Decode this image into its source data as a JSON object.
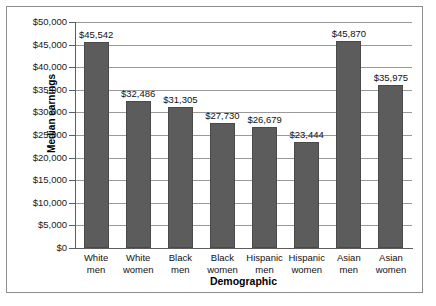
{
  "chart_data": {
    "type": "bar",
    "title": "",
    "xlabel": "Demographic",
    "ylabel": "Median earnings",
    "categories": [
      "White men",
      "White women",
      "Black men",
      "Black women",
      "Hispanic men",
      "Hispanic women",
      "Asian men",
      "Asian women"
    ],
    "category_lines": [
      [
        "White",
        "men"
      ],
      [
        "White",
        "women"
      ],
      [
        "Black",
        "men"
      ],
      [
        "Black",
        "women"
      ],
      [
        "Hispanic",
        "men"
      ],
      [
        "Hispanic",
        "women"
      ],
      [
        "Asian",
        "men"
      ],
      [
        "Asian",
        "women"
      ]
    ],
    "values": [
      45542,
      32486,
      31305,
      27730,
      26679,
      23444,
      45870,
      35975
    ],
    "value_labels": [
      "$45,542",
      "$32,486",
      "$31,305",
      "$27,730",
      "$26,679",
      "$23,444",
      "$45,870",
      "$35,975"
    ],
    "ylim": [
      0,
      50000
    ],
    "ytick_values": [
      0,
      5000,
      10000,
      15000,
      20000,
      25000,
      30000,
      35000,
      40000,
      45000,
      50000
    ],
    "ytick_labels": [
      "$0",
      "$5,000",
      "$10,000",
      "$15,000",
      "$20,000",
      "$25,000",
      "$30,000",
      "$35,000",
      "$40,000",
      "$45,000",
      "$50,000"
    ],
    "grid": true,
    "grid_axis": "y",
    "legend": false,
    "series": [
      {
        "name": "Median earnings",
        "values": [
          45542,
          32486,
          31305,
          27730,
          26679,
          23444,
          45870,
          35975
        ]
      }
    ],
    "colors": {
      "bar_fill": "#5c5c5c",
      "bar_edge": "#4a4a4a",
      "gridline": "#9a9a9a",
      "axis": "#5d5d5d",
      "text": "#111111",
      "background": "#ffffff",
      "border": "#8d8d8d"
    }
  }
}
